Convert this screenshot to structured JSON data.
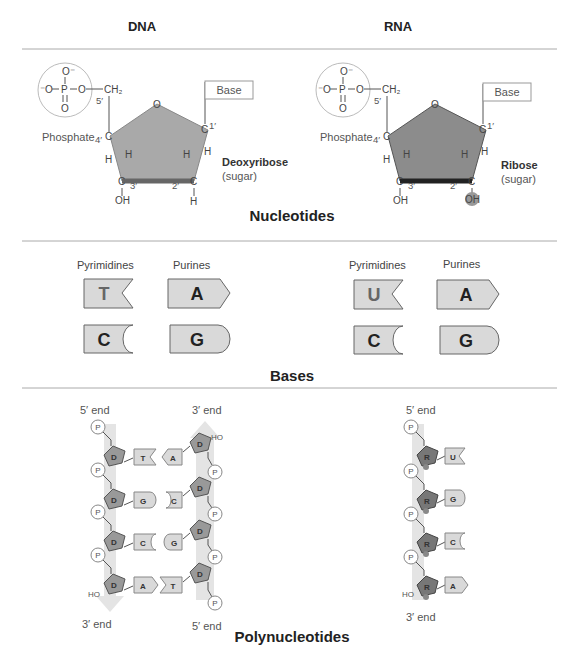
{
  "columns": {
    "dna": "DNA",
    "rna": "RNA"
  },
  "sections": {
    "nucleotides": "Nucleotides",
    "bases": "Bases",
    "polynucleotides": "Polynucleotides"
  },
  "nucleotide": {
    "phosphate_label": "Phosphate",
    "base_label": "Base",
    "atoms": {
      "o_minus": "O⁻",
      "p": "P",
      "o": "O",
      "ch2": "CH₂",
      "c": "C",
      "h": "H",
      "oh": "OH"
    },
    "positions": {
      "p5": "5′",
      "p4": "4′",
      "p3": "3′",
      "p2": "2′",
      "p1": "1′"
    },
    "dna_sugar": {
      "name": "Deoxyribose",
      "note": "(sugar)"
    },
    "rna_sugar": {
      "name": "Ribose",
      "note": "(sugar)"
    }
  },
  "bases": {
    "pyrimidines_label": "Pyrimidines",
    "purines_label": "Purines",
    "dna": {
      "pyrimidines": [
        "T",
        "C"
      ],
      "purines": [
        "A",
        "G"
      ]
    },
    "rna": {
      "pyrimidines": [
        "U",
        "C"
      ],
      "purines": [
        "A",
        "G"
      ]
    }
  },
  "polynucleotides": {
    "five_prime_end": "5′ end",
    "three_prime_end": "3′ end",
    "phosphate": "P",
    "deoxyribose": "D",
    "ribose": "R",
    "ho": "HO",
    "dna_strand_left": [
      "T",
      "G",
      "C",
      "A"
    ],
    "dna_strand_right": [
      "A",
      "C",
      "G",
      "T"
    ],
    "rna_strand": [
      "U",
      "G",
      "C",
      "A"
    ]
  },
  "colors": {
    "sugar_dna": "#a9a9a9",
    "sugar_rna": "#8c8c8c",
    "base_fill": "#d9d9d9",
    "strand_band": "#e4e4e4",
    "divider": "#aaaaaa"
  }
}
